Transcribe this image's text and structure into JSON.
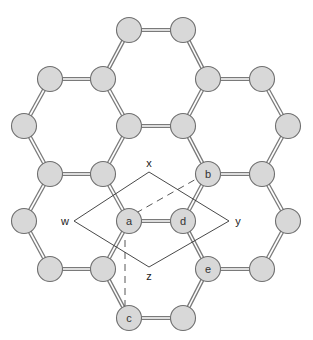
{
  "diagram": {
    "type": "graphene-honeycomb-lattice",
    "colors": {
      "atom_fill": "#d8d8d8",
      "atom_stroke": "#6f6f6f",
      "bond": "#7a7a7a",
      "cell": "#333333"
    },
    "atoms": [
      {
        "id": "t1",
        "x": 129,
        "y": 30,
        "label": ""
      },
      {
        "id": "t2",
        "x": 183,
        "y": 30,
        "label": ""
      },
      {
        "id": "r1a",
        "x": 50,
        "y": 79,
        "label": ""
      },
      {
        "id": "r1b",
        "x": 103,
        "y": 79,
        "label": ""
      },
      {
        "id": "r1c",
        "x": 208,
        "y": 79,
        "label": ""
      },
      {
        "id": "r1d",
        "x": 262,
        "y": 79,
        "label": ""
      },
      {
        "id": "r2a",
        "x": 24,
        "y": 126,
        "label": ""
      },
      {
        "id": "r2b",
        "x": 129,
        "y": 126,
        "label": ""
      },
      {
        "id": "r2c",
        "x": 183,
        "y": 126,
        "label": ""
      },
      {
        "id": "r2d",
        "x": 288,
        "y": 126,
        "label": ""
      },
      {
        "id": "r3a",
        "x": 50,
        "y": 174,
        "label": ""
      },
      {
        "id": "r3b",
        "x": 103,
        "y": 174,
        "label": ""
      },
      {
        "id": "b",
        "x": 208,
        "y": 174,
        "label": "b"
      },
      {
        "id": "r3d",
        "x": 262,
        "y": 174,
        "label": ""
      },
      {
        "id": "r4a",
        "x": 24,
        "y": 221,
        "label": ""
      },
      {
        "id": "a",
        "x": 129,
        "y": 221,
        "label": "a"
      },
      {
        "id": "d",
        "x": 183,
        "y": 221,
        "label": "d"
      },
      {
        "id": "r4d",
        "x": 288,
        "y": 221,
        "label": ""
      },
      {
        "id": "r5a",
        "x": 50,
        "y": 269,
        "label": ""
      },
      {
        "id": "r5b",
        "x": 103,
        "y": 269,
        "label": ""
      },
      {
        "id": "e",
        "x": 208,
        "y": 269,
        "label": "e"
      },
      {
        "id": "r5d",
        "x": 262,
        "y": 269,
        "label": ""
      },
      {
        "id": "c",
        "x": 129,
        "y": 318,
        "label": "c"
      },
      {
        "id": "r6b",
        "x": 183,
        "y": 318,
        "label": ""
      }
    ],
    "bonds": [
      [
        "t1",
        "t2"
      ],
      [
        "t1",
        "r1b"
      ],
      [
        "t2",
        "r1c"
      ],
      [
        "r1a",
        "r1b"
      ],
      [
        "r1c",
        "r1d"
      ],
      [
        "r1a",
        "r2a"
      ],
      [
        "r1b",
        "r2b"
      ],
      [
        "r1c",
        "r2c"
      ],
      [
        "r1d",
        "r2d"
      ],
      [
        "r2b",
        "r2c"
      ],
      [
        "r2a",
        "r3a"
      ],
      [
        "r2b",
        "r3b"
      ],
      [
        "r2c",
        "b"
      ],
      [
        "r2d",
        "r3d"
      ],
      [
        "r3a",
        "r3b"
      ],
      [
        "b",
        "r3d"
      ],
      [
        "r3a",
        "r4a"
      ],
      [
        "r3b",
        "a"
      ],
      [
        "b",
        "d"
      ],
      [
        "r3d",
        "r4d"
      ],
      [
        "a",
        "d"
      ],
      [
        "r4a",
        "r5a"
      ],
      [
        "a",
        "r5b"
      ],
      [
        "d",
        "e"
      ],
      [
        "r4d",
        "r5d"
      ],
      [
        "r5a",
        "r5b"
      ],
      [
        "e",
        "r5d"
      ],
      [
        "r5b",
        "c"
      ],
      [
        "e",
        "r6b"
      ],
      [
        "c",
        "r6b"
      ]
    ],
    "unit_cell": {
      "vertices": [
        {
          "name": "w",
          "x": 74,
          "y": 221,
          "label": "w",
          "lx": 65,
          "ly": 221
        },
        {
          "name": "x",
          "x": 149,
          "y": 172,
          "label": "x",
          "lx": 149,
          "ly": 163
        },
        {
          "name": "y",
          "x": 229,
          "y": 221,
          "label": "y",
          "lx": 238,
          "ly": 221
        },
        {
          "name": "z",
          "x": 149,
          "y": 267,
          "label": "z",
          "lx": 149,
          "ly": 276
        }
      ]
    },
    "dashed_lines": [
      {
        "from": "a",
        "to": "b",
        "x1": 136,
        "y1": 213,
        "x2": 198,
        "y2": 178
      },
      {
        "from": "a",
        "to": "c",
        "x1": 125,
        "y1": 240,
        "x2": 125,
        "y2": 306
      }
    ],
    "labels": {
      "a": "a",
      "b": "b",
      "c": "c",
      "d": "d",
      "e": "e",
      "w": "w",
      "x": "x",
      "y": "y",
      "z": "z"
    }
  }
}
